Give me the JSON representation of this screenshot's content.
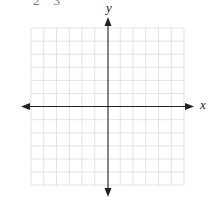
{
  "header": {
    "cropped_numbers": [
      "2",
      "3"
    ]
  },
  "graph": {
    "x_label": "x",
    "y_label": "y",
    "grid": {
      "columns": 12,
      "rows": 12,
      "line_color": "#d9d9d9"
    },
    "axis_color": "#222222"
  }
}
